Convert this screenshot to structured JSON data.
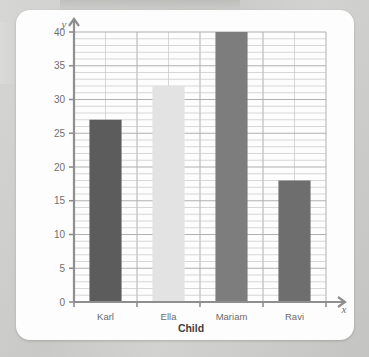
{
  "chart_data": {
    "type": "bar",
    "title": "",
    "xlabel": "Child",
    "ylabel": "Number of books",
    "x_axis_variable": "x",
    "y_axis_variable": "y",
    "categories": [
      "Karl",
      "Ella",
      "Mariam",
      "Ravi"
    ],
    "values": [
      27,
      32,
      40,
      18
    ],
    "bar_colors": [
      "#5c5c5c",
      "#e3e3e3",
      "#7d7d7d",
      "#6e6e6e"
    ],
    "ylim": [
      0,
      40
    ],
    "ytick_labels": [
      "0",
      "5",
      "10",
      "15",
      "20",
      "25",
      "30",
      "35",
      "40"
    ],
    "ytick_values": [
      0,
      5,
      10,
      15,
      20,
      25,
      30,
      35,
      40
    ],
    "y_minor_step": 1,
    "grid": true,
    "legend": "none",
    "axis_arrows": true
  },
  "colors": {
    "page_background": "#cfcfcd",
    "card_background": "#fdfdfd",
    "axis": "#8e8e8e",
    "grid_minor": "#c6c6c6",
    "grid_major": "#b0b0b0",
    "label_text": "#6f6f6f",
    "title_text": "#3f3f3f"
  }
}
